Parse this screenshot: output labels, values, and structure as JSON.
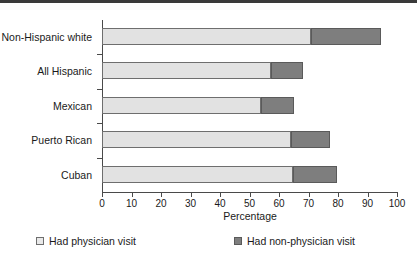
{
  "chart_data": {
    "type": "bar",
    "orientation": "horizontal",
    "stacked": true,
    "title": "",
    "xlabel": "Percentage",
    "ylabel": "",
    "xlim": [
      0,
      100
    ],
    "xticks": [
      0,
      10,
      20,
      30,
      40,
      50,
      60,
      70,
      80,
      90,
      100
    ],
    "xtick_labels": [
      "0",
      "10",
      "20",
      "30",
      "40",
      "50",
      "60",
      "70",
      "80",
      "90",
      "100"
    ],
    "grid": false,
    "legend_position": "bottom",
    "categories": [
      "Non-Hispanic white",
      "All Hispanic",
      "Mexican",
      "Puerto Rican",
      "Cuban"
    ],
    "series": [
      {
        "name": "Had physician visit",
        "color": "#e2e2e2",
        "values": [
          70.8,
          57.3,
          53.9,
          64.1,
          64.7
        ]
      },
      {
        "name": "Had non-physician visit",
        "color": "#7e7e7e",
        "values": [
          23.8,
          10.8,
          11.2,
          13.2,
          15.0
        ]
      }
    ],
    "totals": [
      94.6,
      68.1,
      65.1,
      77.3,
      79.7
    ]
  },
  "axis": {
    "x_title": "Percentage"
  },
  "legend": {
    "items": [
      {
        "label": "Had physician visit",
        "swatch": "light-swatch"
      },
      {
        "label": "Had non-physician visit",
        "swatch": "dark-swatch"
      }
    ]
  }
}
